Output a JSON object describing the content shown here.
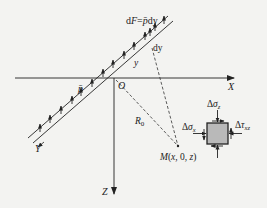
{
  "diagram": {
    "type": "mechanics-free-body-diagram",
    "colors": {
      "background": "#f3f3f1",
      "line": "#222222",
      "element_fill": "#b9b9b9"
    },
    "labels": {
      "force": "dF=p̄dy",
      "dy": "dy",
      "y": "y",
      "p_bar": "p̄",
      "origin": "O",
      "x_axis": "X",
      "y_axis": "Y",
      "z_axis": "Z",
      "radius": "R",
      "radius_sub": "0",
      "point": "M(x, 0, z)",
      "sigma_z_delta": "Δ",
      "sigma_z_sym": "σ",
      "sigma_z_sub": "z",
      "sigma_x_delta": "Δ",
      "sigma_x_sym": "σ",
      "sigma_x_sub": "x",
      "tau_xz_delta": "Δ",
      "tau_xz_sym": "τ",
      "tau_xz_sub": "xz"
    }
  }
}
